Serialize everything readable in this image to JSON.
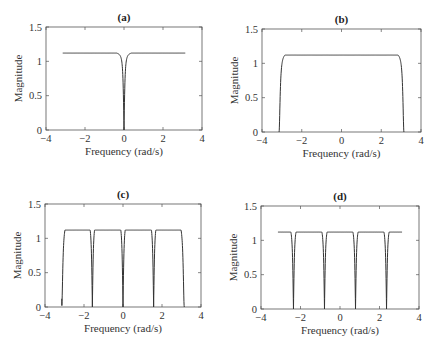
{
  "chart_data": [
    {
      "type": "line",
      "panel": "a",
      "title": "(a)",
      "xlabel": "Frequency (rad/s)",
      "ylabel": "Magnitude",
      "xlim": [
        -4,
        4
      ],
      "ylim": [
        0,
        1.5
      ],
      "xticks": [
        -4,
        -2,
        0,
        2,
        4
      ],
      "yticks": [
        0,
        0.5,
        1,
        1.5
      ],
      "xticklabels": [
        "−4",
        "−2",
        "0",
        "2",
        "4"
      ],
      "yticklabels": [
        "0",
        "0.5",
        "1",
        "1.5"
      ],
      "grid": false,
      "description": "Notch at 0; plateau ~1.1 from -pi to pi",
      "x": [
        -3.14,
        -2.0,
        -1.0,
        -0.5,
        -0.25,
        -0.1,
        0,
        0.1,
        0.25,
        0.5,
        1.0,
        2.0,
        3.14
      ],
      "y": [
        1.1,
        1.09,
        1.06,
        0.98,
        0.8,
        0.45,
        0,
        0.45,
        0.8,
        0.98,
        1.06,
        1.09,
        1.1
      ],
      "notches": [
        0
      ]
    },
    {
      "type": "line",
      "panel": "b",
      "title": "(b)",
      "xlabel": "Frequency (rad/s)",
      "ylabel": "Magnitude",
      "xlim": [
        -4,
        4
      ],
      "ylim": [
        0,
        1.5
      ],
      "xticks": [
        -4,
        -2,
        0,
        2,
        4
      ],
      "yticks": [
        0,
        0.5,
        1,
        1.5
      ],
      "xticklabels": [
        "−4",
        "−2",
        "0",
        "2",
        "4"
      ],
      "yticklabels": [
        "0",
        "0.5",
        "1",
        "1.5"
      ],
      "grid": false,
      "description": "Notches at +/- pi; plateau ~1.1",
      "x": [
        -3.14,
        -3.0,
        -2.9,
        -2.6,
        -2.0,
        0,
        2.0,
        2.6,
        2.9,
        3.0,
        3.14
      ],
      "y": [
        0,
        0.45,
        0.8,
        1.02,
        1.08,
        1.1,
        1.08,
        1.02,
        0.8,
        0.45,
        0
      ],
      "notches": [
        -3.1416,
        3.1416
      ]
    },
    {
      "type": "line",
      "panel": "c",
      "title": "(c)",
      "xlabel": "Frequency (rad/s)",
      "ylabel": "Magnitude",
      "xlim": [
        -4,
        4
      ],
      "ylim": [
        0,
        1.5
      ],
      "xticks": [
        -4,
        -2,
        0,
        2,
        4
      ],
      "yticks": [
        0,
        0.5,
        1,
        1.5
      ],
      "xticklabels": [
        "−4",
        "−2",
        "0",
        "2",
        "4"
      ],
      "yticklabels": [
        "0",
        "0.5",
        "1",
        "1.5"
      ],
      "grid": false,
      "description": "Notches at 0, +/- pi/2, +/- pi; plateau ~1.1; starts ~0.12 at -pi",
      "notches": [
        -3.1416,
        -1.5708,
        0,
        1.5708,
        3.1416
      ],
      "start_value": 0.12
    },
    {
      "type": "line",
      "panel": "d",
      "title": "(d)",
      "xlabel": "Frequency (rad/s)",
      "ylabel": "Magnitude",
      "xlim": [
        -4,
        4
      ],
      "ylim": [
        0,
        1.5
      ],
      "xticks": [
        -4,
        -2,
        0,
        2,
        4
      ],
      "yticks": [
        0,
        0.5,
        1,
        1.5
      ],
      "xticklabels": [
        "−4",
        "−2",
        "0",
        "2",
        "4"
      ],
      "yticklabels": [
        "0",
        "0.5",
        "1",
        "1.5"
      ],
      "grid": false,
      "description": "Notches at +/- pi/4, +/- 3pi/4; plateau ~1.1",
      "notches": [
        -2.3562,
        -0.7854,
        0.7854,
        2.3562
      ]
    }
  ],
  "panels": [
    {
      "title": "(a)",
      "xlabel": "Frequency (rad/s)",
      "ylabel": "Magnitude",
      "box": [
        46,
        27,
        202,
        130
      ]
    },
    {
      "title": "(b)",
      "xlabel": "Frequency (rad/s)",
      "ylabel": "Magnitude",
      "box": [
        262,
        29,
        421,
        132
      ]
    },
    {
      "title": "(c)",
      "xlabel": "Frequency (rad/s)",
      "ylabel": "Magnitude",
      "box": [
        45,
        204,
        201,
        307
      ]
    },
    {
      "title": "(d)",
      "xlabel": "Frequency (rad/s)",
      "ylabel": "Magnitude",
      "box": [
        261,
        206,
        419,
        309
      ]
    }
  ]
}
